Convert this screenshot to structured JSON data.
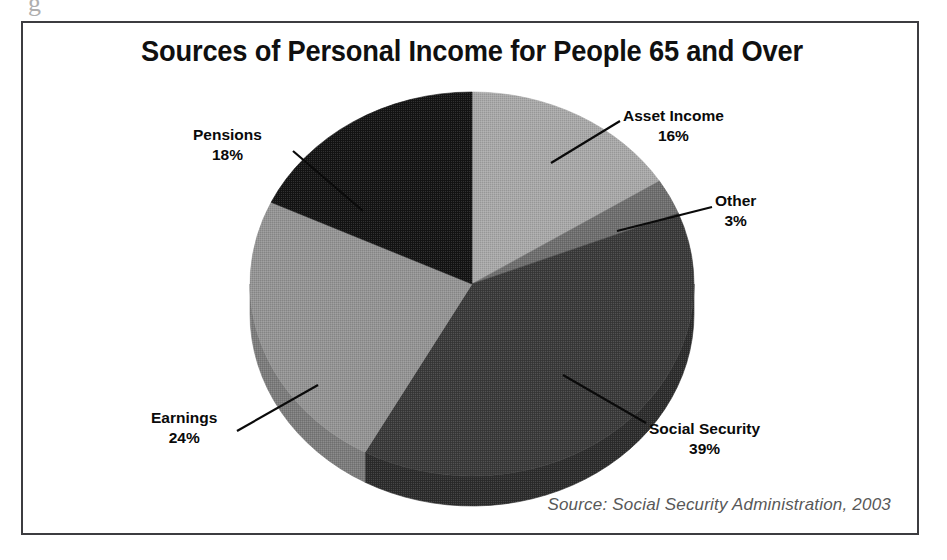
{
  "page": {
    "top_artifact": "g",
    "ghost_text_line1": "to ebo",
    "ghost_text_line2": "onio"
  },
  "figure": {
    "title": "Sources of Personal Income for People 65 and Over",
    "source_note": "Source: Social Security Administration, 2003",
    "frame_color": "#3c3c40",
    "background": "#ffffff"
  },
  "chart_data": {
    "type": "pie",
    "title": "Sources of Personal Income for People 65 and Over",
    "xlabel": "",
    "ylabel": "",
    "units": "percent",
    "total": 100,
    "three_d": true,
    "start_angle_deg": 0,
    "direction": "clockwise",
    "legend": "none (direct labels with leader lines)",
    "categories": [
      "Asset Income",
      "Other",
      "Social Security",
      "Earnings",
      "Pensions"
    ],
    "values": [
      16,
      3,
      39,
      24,
      18
    ],
    "labels": [
      "16%",
      "3%",
      "39%",
      "24%",
      "18%"
    ],
    "colors": [
      "#a8a8a8",
      "#6e6e6e",
      "#3a3a3a",
      "#949494",
      "#141414"
    ],
    "slices": [
      {
        "name": "Asset Income",
        "value": 16,
        "label": "16%",
        "color": "#a8a8a8",
        "side_color": "#8e8e8e"
      },
      {
        "name": "Other",
        "value": 3,
        "label": "3%",
        "color": "#6e6e6e",
        "side_color": "#5a5a5a"
      },
      {
        "name": "Social Security",
        "value": 39,
        "label": "39%",
        "color": "#3a3a3a",
        "side_color": "#2c2c2c"
      },
      {
        "name": "Earnings",
        "value": 24,
        "label": "24%",
        "color": "#949494",
        "side_color": "#7c7c7c"
      },
      {
        "name": "Pensions",
        "value": 18,
        "label": "18%",
        "color": "#141414",
        "side_color": "#0d0d0d"
      }
    ]
  },
  "annotations": {
    "asset_income": {
      "name": "Asset Income",
      "pct": "16%"
    },
    "other": {
      "name": "Other",
      "pct": "3%"
    },
    "social_security": {
      "name": "Social Security",
      "pct": "39%"
    },
    "earnings": {
      "name": "Earnings",
      "pct": "24%"
    },
    "pensions": {
      "name": "Pensions",
      "pct": "18%"
    }
  }
}
